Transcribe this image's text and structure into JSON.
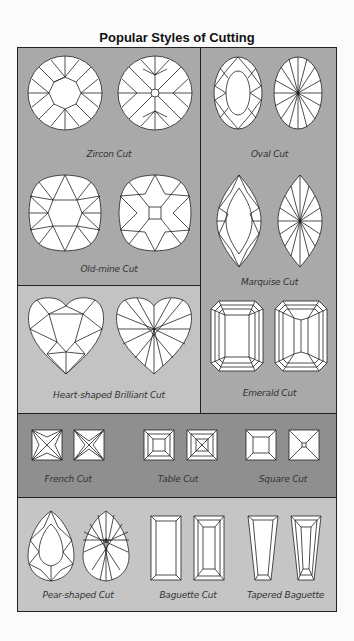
{
  "title": "Popular Styles of Cutting",
  "colors": {
    "panel_gray": "#a9a9a9",
    "panel_light": "#c3c3c3",
    "band_dark": "#8f8f8f",
    "band_light": "#c5c5c5",
    "line": "#222222",
    "gem_fill": "#ffffff"
  },
  "cuts": {
    "zircon": {
      "label": "Zircon Cut",
      "icons": [
        "zircon-top-icon",
        "zircon-bottom-icon"
      ]
    },
    "old_mine": {
      "label": "Old-mine Cut",
      "icons": [
        "old-mine-top-icon",
        "old-mine-bottom-icon"
      ]
    },
    "heart": {
      "label": "Heart-shaped Brilliant Cut",
      "icons": [
        "heart-top-icon",
        "heart-bottom-icon"
      ]
    },
    "oval": {
      "label": "Oval Cut",
      "icons": [
        "oval-top-icon",
        "oval-bottom-icon"
      ]
    },
    "marquise": {
      "label": "Marquise Cut",
      "icons": [
        "marquise-top-icon",
        "marquise-bottom-icon"
      ]
    },
    "emerald": {
      "label": "Emerald Cut",
      "icons": [
        "emerald-top-icon",
        "emerald-bottom-icon"
      ]
    },
    "french": {
      "label": "French Cut",
      "icons": [
        "french-top-icon",
        "french-bottom-icon"
      ]
    },
    "table": {
      "label": "Table Cut",
      "icons": [
        "table-top-icon",
        "table-bottom-icon"
      ]
    },
    "square": {
      "label": "Square Cut",
      "icons": [
        "square-top-icon",
        "square-bottom-icon"
      ]
    },
    "pear": {
      "label": "Pear-shaped Cut",
      "icons": [
        "pear-top-icon",
        "pear-bottom-icon"
      ]
    },
    "baguette": {
      "label": "Baguette Cut",
      "icons": [
        "baguette-top-icon",
        "baguette-bottom-icon"
      ]
    },
    "tapered_baguette": {
      "label": "Tapered Baguette",
      "icons": [
        "tapered-baguette-top-icon",
        "tapered-baguette-bottom-icon"
      ]
    }
  }
}
